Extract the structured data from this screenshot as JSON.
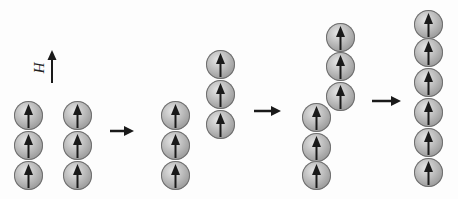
{
  "figure": {
    "field_label": "H",
    "colors": {
      "arrow": "#1a1a1a",
      "sphere_light": "#e6e6e6",
      "sphere_dark": "#7a7a7a",
      "background": "#fdfdfd"
    },
    "stages": [
      {
        "name": "stage-1-two-parallel-chains",
        "chains": [
          {
            "name": "chain-a",
            "x": 14,
            "y_tops": [
              101,
              131,
              161
            ],
            "spin": "up"
          },
          {
            "name": "chain-b",
            "x": 63,
            "y_tops": [
              101,
              131,
              161
            ],
            "spin": "up"
          }
        ]
      },
      {
        "name": "stage-2-chain-shifted",
        "chains": [
          {
            "name": "chain-a",
            "x": 161,
            "y_tops": [
              101,
              131,
              161
            ],
            "spin": "up"
          },
          {
            "name": "chain-b",
            "x": 206,
            "y_tops": [
              50,
              80,
              110
            ],
            "spin": "up"
          }
        ]
      },
      {
        "name": "stage-3-chain-further-shifted",
        "chains": [
          {
            "name": "chain-a",
            "x": 302,
            "y_tops": [
              103,
              133,
              161
            ],
            "spin": "up"
          },
          {
            "name": "chain-b",
            "x": 326,
            "y_tops": [
              23,
              52,
              82
            ],
            "spin": "up"
          }
        ]
      },
      {
        "name": "stage-4-merged-chain",
        "chains": [
          {
            "name": "merged-chain",
            "x": 414,
            "y_tops": [
              10,
              38,
              68,
              98,
              128,
              158
            ],
            "spin": "up"
          }
        ]
      }
    ],
    "transitions": [
      {
        "name": "transition-arrow-1",
        "x1": 110,
        "x2": 134,
        "y": 131
      },
      {
        "name": "transition-arrow-2",
        "x1": 254,
        "x2": 281,
        "y": 111
      },
      {
        "name": "transition-arrow-3",
        "x1": 372,
        "x2": 401,
        "y": 101
      }
    ]
  }
}
